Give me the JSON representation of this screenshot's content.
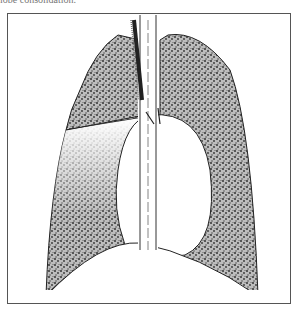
{
  "caption": {
    "text": "lobe consolidation."
  },
  "figure": {
    "colors": {
      "stipple": "#3a3a3a",
      "outline": "#222222",
      "frame": "#555555"
    }
  }
}
